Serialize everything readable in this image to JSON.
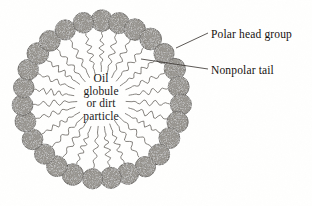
{
  "figure": {
    "type": "micelle-diagram",
    "background_color": "#fffffe",
    "center_caption": {
      "lines": [
        "Oil",
        "globule",
        "or dirt",
        "particle"
      ]
    },
    "labels": [
      {
        "id": "polar-head-group",
        "text": "Polar head group",
        "leader_from": [
          208,
          33
        ],
        "leader_to": [
          176,
          48
        ]
      },
      {
        "id": "nonpolar-tail",
        "text": "Nonpolar tail",
        "leader_from": [
          208,
          69
        ],
        "leader_to": [
          141,
          59
        ]
      }
    ],
    "structure": {
      "center": [
        101,
        100
      ],
      "head_ring_radius": 79,
      "head_radius": 10.5,
      "head_count": 27,
      "head_fill": "#8c8880",
      "head_stroke": "#4a4641",
      "tail_inner_radius": 26,
      "tail_outer_radius": 68,
      "tail_color": "#5d5954",
      "tail_waves": 4
    }
  }
}
